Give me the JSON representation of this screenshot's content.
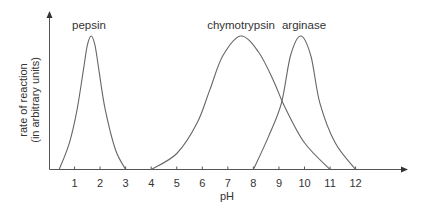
{
  "chart_data": {
    "type": "line",
    "title": "",
    "xlabel": "pH",
    "ylabel": [
      "rate of reaction",
      "(in arbitrary units)"
    ],
    "xlim": [
      0,
      14
    ],
    "ylim": [
      0,
      1
    ],
    "x_ticks": [
      1,
      2,
      3,
      4,
      5,
      6,
      7,
      8,
      9,
      10,
      11,
      12
    ],
    "y_ticks": [],
    "grid": false,
    "legend": "inline labels above each peak",
    "series": [
      {
        "name": "pepsin",
        "peak_ph": 1.65,
        "peak_rate": 1.0,
        "start_ph": 0.4,
        "end_ph": 3.0,
        "points": [
          [
            0.4,
            0
          ],
          [
            0.8,
            0.2
          ],
          [
            1.1,
            0.45
          ],
          [
            1.35,
            0.75
          ],
          [
            1.5,
            0.93
          ],
          [
            1.65,
            1.0
          ],
          [
            1.8,
            0.93
          ],
          [
            1.95,
            0.75
          ],
          [
            2.2,
            0.45
          ],
          [
            2.6,
            0.15
          ],
          [
            3.0,
            0
          ]
        ]
      },
      {
        "name": "chymotrypsin",
        "peak_ph": 7.5,
        "peak_rate": 1.0,
        "start_ph": 4.0,
        "end_ph": 11.0,
        "points": [
          [
            4,
            0
          ],
          [
            5,
            0.12
          ],
          [
            5.8,
            0.35
          ],
          [
            6.3,
            0.6
          ],
          [
            6.8,
            0.85
          ],
          [
            7.5,
            1.0
          ],
          [
            8.2,
            0.88
          ],
          [
            8.8,
            0.66
          ],
          [
            9.2,
            0.48
          ],
          [
            10,
            0.2
          ],
          [
            11,
            0
          ]
        ]
      },
      {
        "name": "arginase",
        "peak_ph": 9.85,
        "peak_rate": 1.0,
        "start_ph": 8.0,
        "end_ph": 12.0,
        "points": [
          [
            8,
            0
          ],
          [
            8.6,
            0.25
          ],
          [
            9.1,
            0.5
          ],
          [
            9.45,
            0.85
          ],
          [
            9.85,
            1.0
          ],
          [
            10.25,
            0.85
          ],
          [
            10.6,
            0.5
          ],
          [
            11.2,
            0.2
          ],
          [
            12,
            0
          ]
        ]
      }
    ]
  },
  "labels": {
    "pepsin": "pepsin",
    "chymotrypsin": "chymotrypsin",
    "arginase": "arginase",
    "xaxis": "pH",
    "yaxis_line1": "rate of reaction",
    "yaxis_line2": "(in arbitrary units)"
  },
  "colors": {
    "axis": "#555555",
    "curve": "#666666",
    "text": "#333333"
  }
}
